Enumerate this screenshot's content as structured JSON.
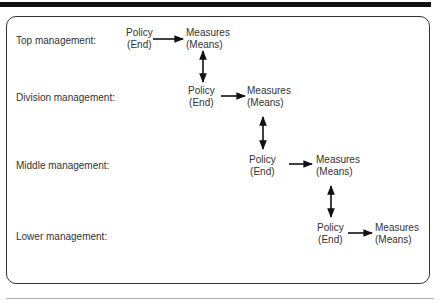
{
  "diagram": {
    "levels": [
      {
        "label": "Top management:",
        "policy": "Policy",
        "policy_sub": "(End)",
        "measures": "Measures",
        "measures_sub": "(Means)"
      },
      {
        "label": "Division management:",
        "policy": "Policy",
        "policy_sub": "(End)",
        "measures": "Measures",
        "measures_sub": "(Means)"
      },
      {
        "label": "Middle management:",
        "policy": "Policy",
        "policy_sub": "(End)",
        "measures": "Measures",
        "measures_sub": "(Means)"
      },
      {
        "label": "Lower management:",
        "policy": "Policy",
        "policy_sub": "(End)",
        "measures": "Measures",
        "measures_sub": "(Means)"
      }
    ],
    "colors": {
      "line": "#111111",
      "text": "#333333",
      "frame": "#333333",
      "rule": "#aaaaaa"
    }
  }
}
